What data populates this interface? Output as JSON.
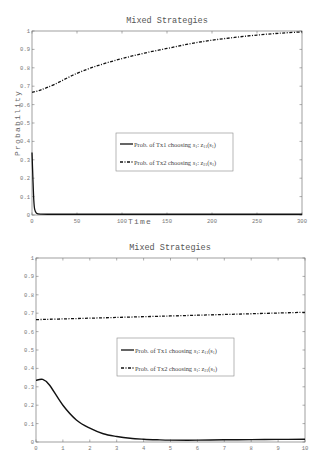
{
  "chart_data": [
    {
      "type": "line",
      "title": "Mixed Strategies",
      "xlabel": "Time",
      "ylabel": "Probability",
      "xlim": [
        0,
        300
      ],
      "ylim": [
        0,
        1
      ],
      "xticks": [
        "0",
        "50",
        "100",
        "150",
        "200",
        "250",
        "300"
      ],
      "yticks": [
        "0",
        "0.1",
        "0.2",
        "0.3",
        "0.4",
        "0.5",
        "0.6",
        "0.7",
        "0.8",
        "0.9",
        "1"
      ],
      "grid": false,
      "legend_position": "center-right",
      "x": [
        0,
        1,
        2,
        3,
        5,
        10,
        25,
        50,
        75,
        100,
        125,
        150,
        175,
        200,
        225,
        250,
        275,
        300
      ],
      "series": [
        {
          "name": "Prob. of Tx1 choosing s1: z11(s1)",
          "style": "solid",
          "values": [
            0.34,
            0.2,
            0.08,
            0.03,
            0.01,
            0.005,
            0.004,
            0.004,
            0.004,
            0.004,
            0.004,
            0.004,
            0.004,
            0.004,
            0.004,
            0.004,
            0.004,
            0.004
          ]
        },
        {
          "name": "Prob. of Tx2 choosing s1: z21(s1)",
          "style": "dash-dot",
          "values": [
            0.667,
            0.668,
            0.669,
            0.67,
            0.672,
            0.68,
            0.71,
            0.77,
            0.815,
            0.85,
            0.88,
            0.905,
            0.93,
            0.95,
            0.965,
            0.978,
            0.988,
            0.995
          ]
        }
      ]
    },
    {
      "type": "line",
      "title": "Mixed Strategies",
      "xlabel": "",
      "ylabel": "",
      "xlim": [
        0,
        10
      ],
      "ylim": [
        0,
        1
      ],
      "xticks": [
        "0",
        "1",
        "2",
        "3",
        "4",
        "5",
        "6",
        "7",
        "8",
        "9",
        "10"
      ],
      "yticks": [
        "0",
        "0.1",
        "0.2",
        "0.3",
        "0.4",
        "0.5",
        "0.6",
        "0.7",
        "0.8",
        "0.9",
        "1"
      ],
      "grid": false,
      "legend_position": "center-right",
      "x": [
        0,
        0.25,
        0.5,
        1,
        1.5,
        2,
        2.5,
        3,
        3.5,
        4,
        4.5,
        5,
        6,
        7,
        8,
        9,
        10
      ],
      "series": [
        {
          "name": "Prob. of Tx1 choosing s1: z11(s1)",
          "style": "solid",
          "values": [
            0.335,
            0.34,
            0.31,
            0.2,
            0.12,
            0.075,
            0.045,
            0.03,
            0.02,
            0.015,
            0.012,
            0.01,
            0.01,
            0.012,
            0.013,
            0.014,
            0.015
          ]
        },
        {
          "name": "Prob. of Tx2 choosing s1: z21(s1)",
          "style": "dash-dot",
          "values": [
            0.665,
            0.666,
            0.667,
            0.669,
            0.671,
            0.673,
            0.675,
            0.677,
            0.679,
            0.681,
            0.683,
            0.685,
            0.689,
            0.693,
            0.697,
            0.701,
            0.705
          ]
        }
      ]
    }
  ],
  "legend": {
    "tx1_prefix": "Prob. of Tx1 choosing ",
    "tx1_var": "s",
    "tx1_var_sub": "1",
    "tx1_fn": ": z",
    "tx1_fn_sub": "11",
    "tx1_arg": "(s",
    "tx1_arg_sub": "1",
    "tx1_close": ")",
    "tx2_prefix": "Prob. of Tx2 choosing ",
    "tx2_var": "s",
    "tx2_var_sub": "1",
    "tx2_fn": ": z",
    "tx2_fn_sub": "21",
    "tx2_arg": "(s",
    "tx2_arg_sub": "1",
    "tx2_close": ")"
  },
  "colors": {
    "axes": "#6a6a6a",
    "line": "#111111",
    "text": "#555555"
  }
}
